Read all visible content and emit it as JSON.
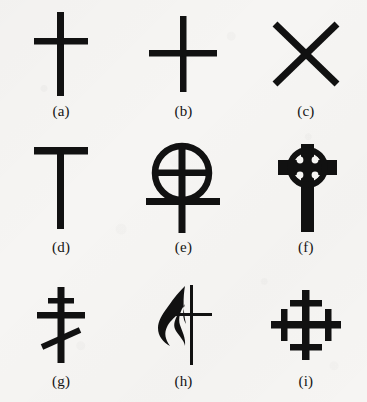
{
  "figure": {
    "background_color": "#f6f5f3",
    "ink_color": "#111111",
    "columns": 3,
    "rows": 3,
    "total_items": 9
  },
  "items": [
    {
      "key": "a",
      "caption": "(a)",
      "icon_name": "latin-cross-icon",
      "description": "Latin cross",
      "row": 1,
      "column": 1
    },
    {
      "key": "b",
      "caption": "(b)",
      "icon_name": "greek-cross-icon",
      "description": "Greek cross",
      "row": 1,
      "column": 2
    },
    {
      "key": "c",
      "caption": "(c)",
      "icon_name": "saltire-cross-icon",
      "description": "Saint Andrew's cross (saltire)",
      "row": 1,
      "column": 3
    },
    {
      "key": "d",
      "caption": "(d)",
      "icon_name": "tau-cross-icon",
      "description": "Tau cross (Saint Anthony's cross)",
      "row": 2,
      "column": 1
    },
    {
      "key": "e",
      "caption": "(e)",
      "icon_name": "coptic-circled-cross-icon",
      "description": "Circled cross with lower crossbar",
      "row": 2,
      "column": 2
    },
    {
      "key": "f",
      "caption": "(f)",
      "icon_name": "celtic-cross-icon",
      "description": "Celtic ringed cross",
      "row": 2,
      "column": 3
    },
    {
      "key": "g",
      "caption": "(g)",
      "icon_name": "russian-orthodox-cross-icon",
      "description": "Russian Orthodox three-bar cross with slanted footrest",
      "row": 3,
      "column": 1
    },
    {
      "key": "h",
      "caption": "(h)",
      "icon_name": "cross-and-flame-icon",
      "description": "Cross and flame",
      "row": 3,
      "column": 2
    },
    {
      "key": "i",
      "caption": "(i)",
      "icon_name": "cross-crosslet-icon",
      "description": "Cross crosslet",
      "row": 3,
      "column": 3
    }
  ]
}
